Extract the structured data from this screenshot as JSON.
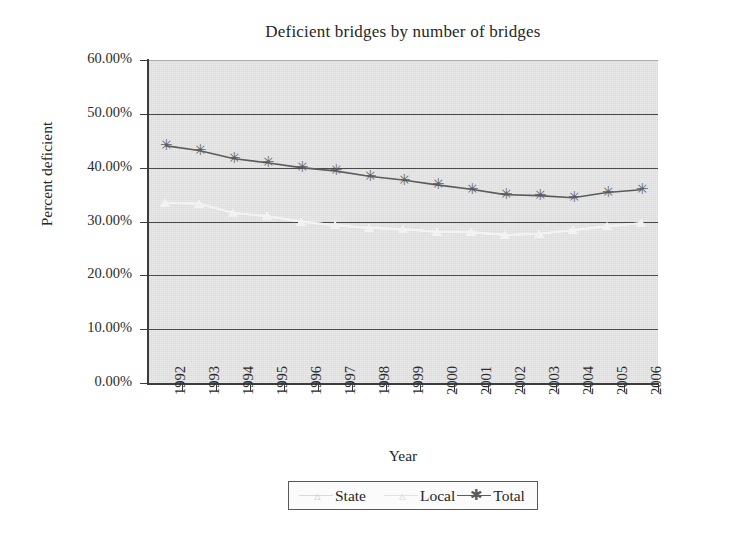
{
  "chart_data": {
    "type": "line",
    "title": "Deficient bridges by number of bridges",
    "xlabel": "Year",
    "ylabel": "Percent deficient",
    "categories": [
      "1992",
      "1993",
      "1994",
      "1995",
      "1996",
      "1997",
      "1998",
      "1999",
      "2000",
      "2001",
      "2002",
      "2003",
      "2004",
      "2005",
      "2006"
    ],
    "ylim": [
      0,
      60
    ],
    "ytick_labels": [
      "60.00%",
      "50.00%",
      "40.00%",
      "30.00%",
      "20.00%",
      "10.00%",
      "0.00%"
    ],
    "ytick_values": [
      60,
      50,
      40,
      30,
      20,
      10,
      0
    ],
    "grid": true,
    "legend_position": "bottom-center",
    "series": [
      {
        "name": "State",
        "color": "#fdfdfd",
        "marker": "triangle",
        "values": [
          33.5,
          33.3,
          31.6,
          31.0,
          30.0,
          29.3,
          28.8,
          28.6,
          28.1,
          28.0,
          27.5,
          27.7,
          28.4,
          29.1,
          29.7
        ]
      },
      {
        "name": "Local",
        "color": "#f2f2f2",
        "marker": "triangle",
        "values": [
          33.5,
          33.3,
          31.6,
          31.0,
          30.0,
          29.3,
          28.8,
          28.6,
          28.1,
          28.0,
          27.5,
          27.7,
          28.4,
          29.1,
          29.7
        ]
      },
      {
        "name": "Total",
        "color": "#5b5b5b",
        "marker": "asterisk",
        "values": [
          44.1,
          43.2,
          41.7,
          40.9,
          40.0,
          39.4,
          38.4,
          37.7,
          36.8,
          36.0,
          35.0,
          34.8,
          34.4,
          35.4,
          35.9
        ]
      }
    ]
  },
  "legend": {
    "entries": [
      {
        "label": "State",
        "marker": "triangle-marker",
        "color": "#d9d9d9"
      },
      {
        "label": "Local",
        "marker": "triangle-marker",
        "color": "#e6e6e6"
      },
      {
        "label": "Total",
        "marker": "asterisk-marker",
        "color": "#5b5b5b"
      }
    ]
  },
  "colors": {
    "plot_background": "#e2e2e2",
    "gridline": "#4a4a4a",
    "axis": "#3c3c3c",
    "text": "#2b2b2b"
  }
}
